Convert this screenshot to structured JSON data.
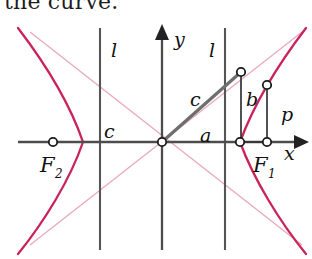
{
  "caption": {
    "text": "the curve."
  },
  "figure": {
    "colors": {
      "curve": "#c9235a",
      "asymptote": "#e9a8bf",
      "axis": "#4d4d4d",
      "directrix": "#555555",
      "triangle": "#6e6e6e",
      "label": "#111111",
      "background": "#ffffff"
    },
    "axes": {
      "x_label": "x",
      "y_label": "y",
      "origin_label": "",
      "x_axis_y": 142,
      "y_axis_x": 162
    },
    "points": [
      {
        "name": "origin",
        "label": "",
        "x": 162,
        "y": 142
      },
      {
        "name": "focus-left",
        "label": "F2",
        "label_main": "F",
        "label_sub": "2",
        "x": 53,
        "y": 142
      },
      {
        "name": "vertex-right",
        "label": "",
        "x": 240,
        "y": 142
      },
      {
        "name": "focus-right",
        "label": "F1",
        "label_main": "F",
        "label_sub": "1",
        "x": 267,
        "y": 142
      },
      {
        "name": "triangle-apex",
        "label": "",
        "x": 241,
        "y": 72
      },
      {
        "name": "curve-point-p",
        "label": "",
        "x": 267,
        "y": 85
      }
    ],
    "segments": [
      {
        "name": "hypotenuse-c",
        "label": "c",
        "label_x": 196,
        "label_y": 100
      },
      {
        "name": "base-a",
        "label": "a",
        "label_x": 205,
        "label_y": 136
      },
      {
        "name": "leg-b",
        "label": "b",
        "label_x": 250,
        "label_y": 100
      },
      {
        "name": "semi-latus-p",
        "label": "p",
        "label_x": 285,
        "label_y": 115
      },
      {
        "name": "focal-distance-c",
        "label": "c",
        "label_x": 108,
        "label_y": 133
      }
    ],
    "directrices": [
      {
        "name": "directrix-left",
        "label": "l",
        "x": 100,
        "label_x": 114,
        "label_y": 56
      },
      {
        "name": "directrix-right",
        "label": "l",
        "x": 225,
        "label_x": 211,
        "label_y": 56
      }
    ],
    "curve": {
      "name": "hyperbola",
      "branches": 2,
      "vertex_left_x": 83,
      "vertex_right_x": 240
    },
    "asymptotes": {
      "name": "asymptote-pair",
      "count": 2
    }
  }
}
